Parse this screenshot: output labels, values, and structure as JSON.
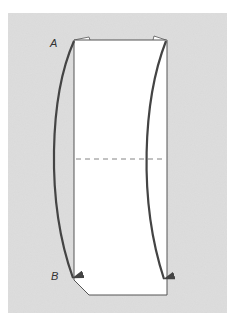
{
  "diagram": {
    "type": "paper-folding-instruction",
    "background_color": "#d9d9d9",
    "paper_color": "#ffffff",
    "line_color": "#444444",
    "labels": {
      "point_a": "A",
      "point_b": "B"
    },
    "elements": [
      {
        "kind": "paper",
        "shape": "tall rectangle with chamfered bottom-left corner"
      },
      {
        "kind": "fold-line",
        "style": "dashed",
        "position": "horizontal, mid-height"
      },
      {
        "kind": "arrow",
        "from": "A (top-left corner)",
        "to": "B (bottom-left)",
        "curve": "bows left"
      },
      {
        "kind": "arrow",
        "from": "top-right corner",
        "to": "bottom-right",
        "curve": "bows left"
      }
    ]
  }
}
